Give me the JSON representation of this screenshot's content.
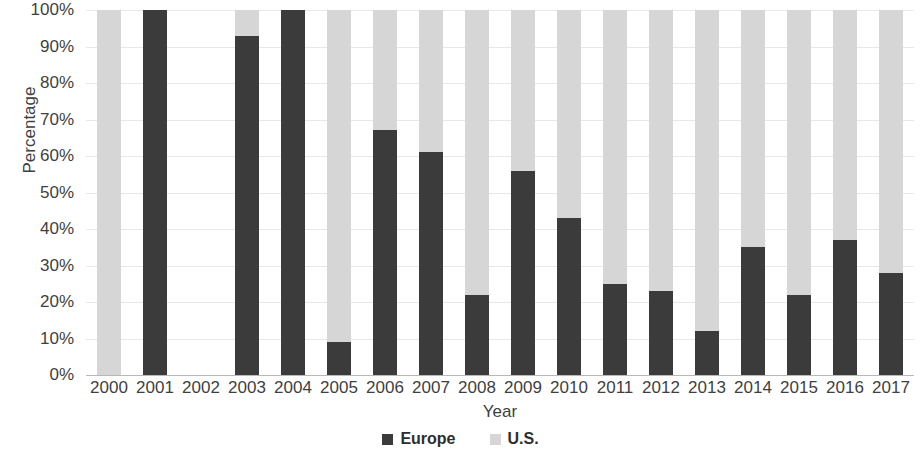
{
  "chart_data": {
    "type": "bar",
    "stacked": true,
    "stack_mode": "percent",
    "title": "",
    "xlabel": "Year",
    "ylabel": "Percentage",
    "ylim": [
      0,
      100
    ],
    "ytick_labels": [
      "100%",
      "90%",
      "80%",
      "70%",
      "60%",
      "50%",
      "40%",
      "30%",
      "20%",
      "10%",
      "0%"
    ],
    "ytick_values": [
      100,
      90,
      80,
      70,
      60,
      50,
      40,
      30,
      20,
      10,
      0
    ],
    "grid": true,
    "legend_position": "bottom",
    "categories": [
      "2000",
      "2001",
      "2002",
      "2003",
      "2004",
      "2005",
      "2006",
      "2007",
      "2008",
      "2009",
      "2010",
      "2011",
      "2012",
      "2013",
      "2014",
      "2015",
      "2016",
      "2017"
    ],
    "series": [
      {
        "name": "Europe",
        "color": "#3b3b3b",
        "values": [
          0,
          100,
          null,
          93,
          100,
          9,
          67,
          61,
          22,
          56,
          43,
          25,
          23,
          12,
          35,
          22,
          37,
          28
        ]
      },
      {
        "name": "U.S.",
        "color": "#d6d6d6",
        "values": [
          100,
          0,
          null,
          7,
          0,
          91,
          33,
          39,
          78,
          44,
          57,
          75,
          77,
          88,
          65,
          78,
          63,
          72
        ]
      }
    ]
  },
  "legend": {
    "items": [
      {
        "label": "Europe",
        "color": "#3b3b3b"
      },
      {
        "label": "U.S.",
        "color": "#d6d6d6"
      }
    ]
  }
}
